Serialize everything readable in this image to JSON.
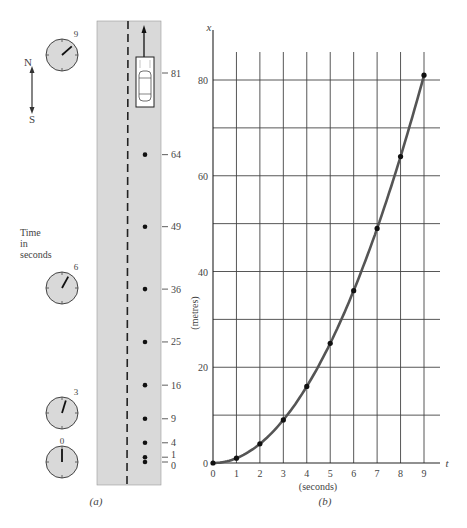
{
  "panel_a": {
    "caption": "(a)",
    "compass": {
      "north": "N",
      "south": "S"
    },
    "time_label": [
      "Time",
      "in",
      "seconds"
    ],
    "clocks": [
      {
        "label": "9",
        "t": 9,
        "cy": 55
      },
      {
        "label": "6",
        "t": 6,
        "cy": 288
      },
      {
        "label": "3",
        "t": 3,
        "cy": 413
      },
      {
        "label": "0",
        "t": 0,
        "cy": 462
      }
    ],
    "road_markers": [
      {
        "label": "81",
        "value": 81
      },
      {
        "label": "64",
        "value": 64
      },
      {
        "label": "49",
        "value": 49
      },
      {
        "label": "36",
        "value": 36
      },
      {
        "label": "25",
        "value": 25
      },
      {
        "label": "16",
        "value": 16
      },
      {
        "label": "9",
        "value": 9
      },
      {
        "label": "4",
        "value": 4
      },
      {
        "label": "1",
        "value": 1
      },
      {
        "label": "0",
        "value": 0
      }
    ],
    "colors": {
      "road": "#d9d9d9",
      "clock_face": "#d9d9d9",
      "ink": "#222222"
    }
  },
  "panel_b": {
    "caption": "(b)",
    "colors": {
      "curve": "#555555",
      "grid": "#444444",
      "points": "#111111"
    }
  },
  "chart_data": {
    "type": "line",
    "title": "",
    "xlabel": "(seconds)",
    "ylabel": "(metres)",
    "x_axis_symbol": "t",
    "y_axis_symbol": "x",
    "x": [
      0,
      1,
      2,
      3,
      4,
      5,
      6,
      7,
      8,
      9
    ],
    "series": [
      {
        "name": "x = t^2",
        "values": [
          0,
          1,
          4,
          9,
          16,
          25,
          36,
          49,
          64,
          81
        ]
      }
    ],
    "x_ticks": [
      "0",
      "1",
      "2",
      "3",
      "4",
      "5",
      "6",
      "7",
      "8",
      "9"
    ],
    "y_ticks": [
      "0",
      "20",
      "40",
      "60",
      "80"
    ],
    "xlim": [
      0,
      9
    ],
    "ylim": [
      0,
      85
    ],
    "grid": true,
    "grid_y_step": 10,
    "legend": "none"
  }
}
